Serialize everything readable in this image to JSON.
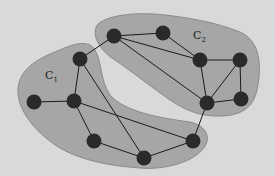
{
  "background": "#d9d9d9",
  "cluster_fill": "#a6a6a6",
  "cluster_stroke": "#8a8a8a",
  "node_color": "#2a2a2a",
  "edge_color": "#1a1a1a",
  "clusters": [
    {
      "id": "C1",
      "label": "C",
      "sub": "1",
      "label_x": 43,
      "label_y": 80
    },
    {
      "id": "C2",
      "label": "C",
      "sub": "2",
      "label_x": 193,
      "label_y": 39
    }
  ],
  "nodes": [
    {
      "id": "A",
      "x": 80,
      "y": 59
    },
    {
      "id": "B",
      "x": 114,
      "y": 36
    },
    {
      "id": "C",
      "x": 163,
      "y": 33
    },
    {
      "id": "D",
      "x": 200,
      "y": 60
    },
    {
      "id": "E",
      "x": 240,
      "y": 60
    },
    {
      "id": "F",
      "x": 34,
      "y": 102
    },
    {
      "id": "G",
      "x": 74,
      "y": 101
    },
    {
      "id": "H",
      "x": 207,
      "y": 103
    },
    {
      "id": "I",
      "x": 241,
      "y": 99
    },
    {
      "id": "J",
      "x": 94,
      "y": 141
    },
    {
      "id": "K",
      "x": 144,
      "y": 158
    },
    {
      "id": "L",
      "x": 193,
      "y": 141
    }
  ],
  "edges": [
    [
      "F",
      "G"
    ],
    [
      "A",
      "G"
    ],
    [
      "A",
      "B"
    ],
    [
      "A",
      "K"
    ],
    [
      "G",
      "J"
    ],
    [
      "G",
      "L"
    ],
    [
      "J",
      "K"
    ],
    [
      "K",
      "L"
    ],
    [
      "L",
      "H"
    ],
    [
      "B",
      "C"
    ],
    [
      "B",
      "D"
    ],
    [
      "B",
      "H"
    ],
    [
      "C",
      "D"
    ],
    [
      "D",
      "E"
    ],
    [
      "D",
      "H"
    ],
    [
      "E",
      "H"
    ],
    [
      "E",
      "I"
    ],
    [
      "H",
      "I"
    ]
  ]
}
